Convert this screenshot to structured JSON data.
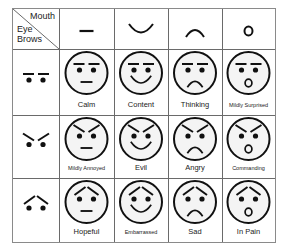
{
  "header": {
    "corner": {
      "mouth_label": "Mouth",
      "eyebrows_line1": "Eye",
      "eyebrows_line2": "Brows"
    },
    "mouths": [
      {
        "name": "flat-mouth",
        "shape": "flat"
      },
      {
        "name": "smile-mouth",
        "shape": "smile"
      },
      {
        "name": "frown-mouth",
        "shape": "frown"
      },
      {
        "name": "open-mouth",
        "shape": "o"
      }
    ]
  },
  "rows": [
    {
      "eyebrows": "flat",
      "faces": [
        {
          "label": "Calm",
          "mouth": "flat",
          "size": 7.5
        },
        {
          "label": "Content",
          "mouth": "smile",
          "size": 7.5
        },
        {
          "label": "Thinking",
          "mouth": "frown",
          "size": 7.5
        },
        {
          "label": "Mildly Surprised",
          "mouth": "o",
          "size": 5.5
        }
      ]
    },
    {
      "eyebrows": "angry",
      "faces": [
        {
          "label": "Mildly Annoyed",
          "mouth": "flat",
          "size": 5.5
        },
        {
          "label": "Evil",
          "mouth": "smile",
          "size": 7.5
        },
        {
          "label": "Angry",
          "mouth": "frown",
          "size": 7.5
        },
        {
          "label": "Commanding",
          "mouth": "o",
          "size": 5.5
        }
      ]
    },
    {
      "eyebrows": "worried",
      "faces": [
        {
          "label": "Hopeful",
          "mouth": "flat",
          "size": 7.5
        },
        {
          "label": "Embarrassed",
          "mouth": "smile",
          "size": 5.5
        },
        {
          "label": "Sad",
          "mouth": "frown",
          "size": 7.5
        },
        {
          "label": "In Pain",
          "mouth": "o",
          "size": 7.5
        }
      ]
    }
  ],
  "colors": {
    "stroke": "#111111",
    "face_fill": "#f4f4f4",
    "grid": "#6a6a6a"
  }
}
